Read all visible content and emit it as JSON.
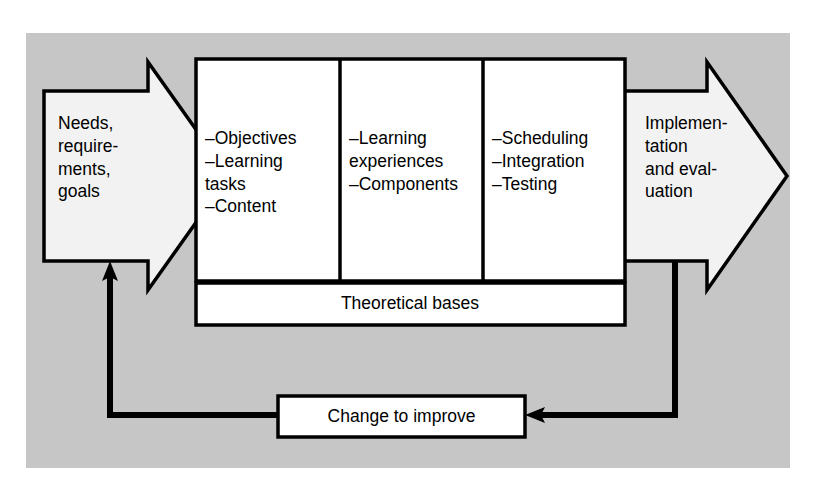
{
  "diagram": {
    "title_hidden": "",
    "background_color": "#c6c6c6",
    "ink_color": "#000000",
    "shape_fill": "#f2f2f2",
    "box_fill": "#ffffff",
    "input_arrow": {
      "label": "Needs,\nrequire-\nments,\ngoals",
      "direction": "right"
    },
    "output_arrow": {
      "label": "Implemen-\ntation\nand eval-\nuation",
      "direction": "right"
    },
    "columns": [
      {
        "label": "–Objectives\n–Learning\n   tasks\n–Content"
      },
      {
        "label": "–Learning\n   experiences\n–Components"
      },
      {
        "label": "–Scheduling\n–Integration\n–Testing"
      }
    ],
    "foundation_bar": {
      "label": "Theoretical  bases"
    },
    "feedback_box": {
      "label": "Change to improve"
    },
    "feedback_path_note": "from output arrow down and left into feedback box, then left and up into input arrow"
  }
}
